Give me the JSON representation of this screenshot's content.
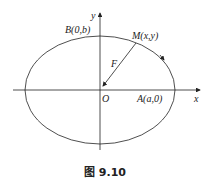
{
  "diagram": {
    "labels": {
      "x_axis": "x",
      "y_axis": "y",
      "origin": "O",
      "point_a": "A(a,0)",
      "point_b": "B(0,b)",
      "point_m": "M(x,y)",
      "force": "F"
    },
    "caption": "图 9.10",
    "colors": {
      "stroke": "#222222",
      "background": "#ffffff"
    }
  }
}
